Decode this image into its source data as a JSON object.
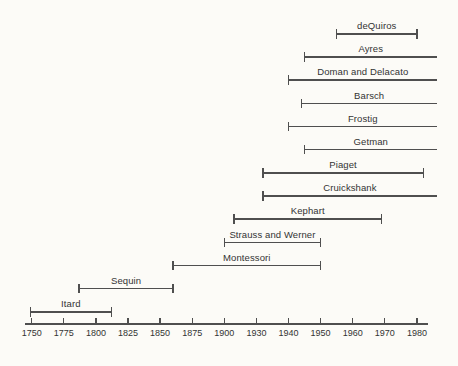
{
  "chart_data": {
    "type": "timeline",
    "title": "",
    "legend": "none",
    "grid": "off",
    "axis": {
      "position": "bottom",
      "tick_labels": [
        "1750",
        "1775",
        "1800",
        "1825",
        "1850",
        "1875",
        "1900",
        "1930",
        "1940",
        "1950",
        "1960",
        "1970",
        "1980"
      ],
      "scale_note": "25-year steps 1750-1900, then 1900-1930, then 10-year steps 1930-1980, evenly spaced ticks"
    },
    "series": [
      {
        "name": "deQuiros",
        "start": 1955,
        "end": 1980,
        "open_right": false
      },
      {
        "name": "Ayres",
        "start": 1945,
        "end": null,
        "open_right": true
      },
      {
        "name": "Doman and Delacato",
        "start": 1940,
        "end": null,
        "open_right": true
      },
      {
        "name": "Barsch",
        "start": 1944,
        "end": null,
        "open_right": true
      },
      {
        "name": "Frostig",
        "start": 1940,
        "end": null,
        "open_right": true
      },
      {
        "name": "Getman",
        "start": 1945,
        "end": null,
        "open_right": true
      },
      {
        "name": "Piaget",
        "start": 1932,
        "end": 1982,
        "open_right": false
      },
      {
        "name": "Cruickshank",
        "start": 1932,
        "end": null,
        "open_right": true
      },
      {
        "name": "Kephart",
        "start": 1909,
        "end": 1969,
        "open_right": false
      },
      {
        "name": "Strauss and Werner",
        "start": 1900,
        "end": 1950,
        "open_right": false
      },
      {
        "name": "Montessori",
        "start": 1860,
        "end": 1950,
        "open_right": false
      },
      {
        "name": "Sequin",
        "start": 1787,
        "end": 1860,
        "open_right": false
      },
      {
        "name": "Itard",
        "start": 1749,
        "end": 1812,
        "open_right": false
      }
    ]
  },
  "colors": {
    "background": "#fcfbf7",
    "line": "#4f4f4f",
    "text": "#333333"
  }
}
